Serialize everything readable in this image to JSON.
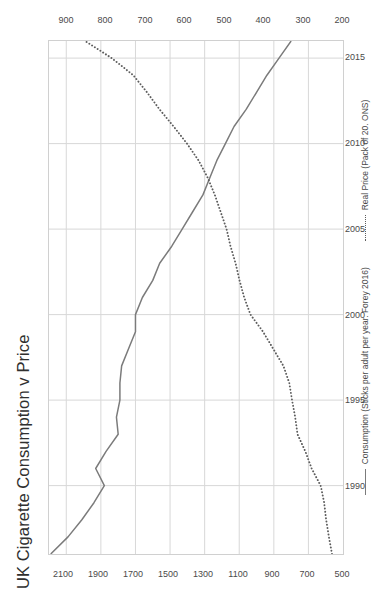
{
  "chart_data": {
    "type": "line",
    "title": "UK Cigarette Consumption v Price",
    "orientation": "rotated-90-ccw",
    "xlabel": "",
    "ylabel": "",
    "grid": true,
    "legend_position": "bottom",
    "x": [
      1986,
      1987,
      1988,
      1989,
      1990,
      1991,
      1992,
      1993,
      1994,
      1995,
      1996,
      1997,
      1998,
      1999,
      2000,
      2001,
      2002,
      2003,
      2004,
      2005,
      2006,
      2007,
      2008,
      2009,
      2010,
      2011,
      2012,
      2013,
      2014,
      2015,
      2016
    ],
    "x_axis": {
      "name": "Year",
      "ticks": [
        1990,
        1995,
        2000,
        2005,
        2010,
        2015
      ],
      "range": [
        1986,
        2016
      ]
    },
    "primary_axis": {
      "name": "Consumption (Sticks per adult per year)",
      "ticks": [
        2100,
        1900,
        1700,
        1500,
        1300,
        1100,
        900,
        700,
        500
      ],
      "range": [
        500,
        2200
      ],
      "inverted": true
    },
    "secondary_axis": {
      "name": "Real Price (Pack of 20)",
      "ticks": [
        900,
        800,
        700,
        600,
        500,
        400,
        300,
        200
      ],
      "range": [
        200,
        950
      ],
      "inverted": true
    },
    "series": [
      {
        "name": "Consumption (Sticks per adult per year. Forey 2016)",
        "axis": "primary",
        "style": "solid",
        "color": "#7b7b7b",
        "values": [
          2190,
          2090,
          2010,
          1940,
          1880,
          1930,
          1870,
          1800,
          1810,
          1790,
          1790,
          1780,
          1740,
          1700,
          1700,
          1660,
          1600,
          1560,
          1490,
          1430,
          1370,
          1310,
          1270,
          1230,
          1180,
          1130,
          1060,
          1000,
          940,
          870,
          800
        ]
      },
      {
        "name": "Real Price (Pack of 20. ONS)",
        "axis": "secondary",
        "style": "dotted",
        "color": "#5d5d5d",
        "values": [
          228,
          236,
          243,
          248,
          257,
          280,
          296,
          316,
          322,
          330,
          337,
          352,
          378,
          404,
          436,
          452,
          464,
          474,
          487,
          497,
          512,
          527,
          545,
          568,
          598,
          632,
          668,
          700,
          735,
          790,
          858
        ]
      }
    ],
    "legend": [
      {
        "label": "Consumption (Sticks per adult per year. Forey 2016)",
        "style": "solid"
      },
      {
        "label": "Real Price (Pack of 20. ONS)",
        "style": "dotted"
      }
    ]
  }
}
